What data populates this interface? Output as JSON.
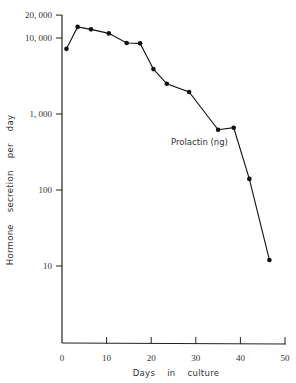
{
  "chart_data": {
    "type": "line",
    "title": "",
    "xlabel": "Days    in    culture",
    "ylabel": "Hormone    secretion    per    day",
    "yscale": "log",
    "xlim": [
      0,
      50
    ],
    "ylim": [
      10,
      20000
    ],
    "grid": false,
    "x_ticks": [
      0,
      10,
      20,
      30,
      40,
      50
    ],
    "x_tick_labels": [
      "0",
      "10",
      "20",
      "30",
      "40",
      "50"
    ],
    "y_ticks": [
      10,
      100,
      1000,
      10000,
      20000
    ],
    "y_tick_labels": [
      "10",
      "100",
      "1, 000",
      "10, 000",
      "20, 000"
    ],
    "series": [
      {
        "name": "Prolactin (ng)",
        "x": [
          1,
          3.5,
          6.5,
          10.5,
          14.5,
          17.5,
          20.5,
          23.5,
          28.5,
          35,
          38.5,
          42,
          46.5
        ],
        "values": [
          7200,
          14000,
          13000,
          11500,
          8600,
          8500,
          3900,
          2500,
          1950,
          620,
          660,
          140,
          12
        ]
      }
    ],
    "annotations": [
      {
        "text": "Prolactin (ng)",
        "x": 30,
        "y": 450
      }
    ],
    "legend": "none (inline label)"
  }
}
